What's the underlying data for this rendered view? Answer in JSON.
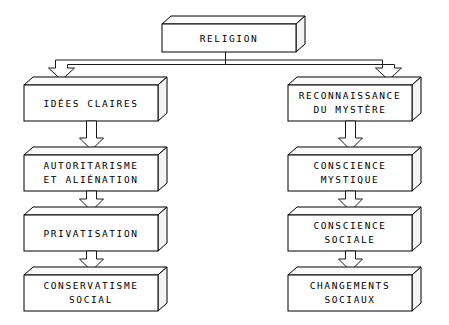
{
  "diagram": {
    "title": "RELIGION",
    "root": {
      "id": "religion",
      "label": "RELIGION",
      "lines": [
        "RELIGION"
      ]
    },
    "branches": [
      {
        "id": "left-branch",
        "name": "idees-claires-chain",
        "nodes": [
          {
            "id": "idees-claires",
            "lines": [
              "IDÉES CLAIRES"
            ]
          },
          {
            "id": "autoritarisme",
            "lines": [
              "AUTORITARISME",
              "ET ALIÉNATION"
            ]
          },
          {
            "id": "privatisation",
            "lines": [
              "PRIVATISATION"
            ]
          },
          {
            "id": "conservatisme",
            "lines": [
              "CONSERVATISME",
              "SOCIAL"
            ]
          }
        ]
      },
      {
        "id": "right-branch",
        "name": "reconnaissance-chain",
        "nodes": [
          {
            "id": "reconnaissance",
            "lines": [
              "RECONNAISSANCE",
              "DU MYSTÈRE"
            ]
          },
          {
            "id": "conscience-mystique",
            "lines": [
              "CONSCIENCE",
              "MYSTIQUE"
            ]
          },
          {
            "id": "conscience-sociale",
            "lines": [
              "CONSCIENCE",
              "SOCIALE"
            ]
          },
          {
            "id": "changements-sociaux",
            "lines": [
              "CHANGEMENTS",
              "SOCIAUX"
            ]
          }
        ]
      }
    ],
    "colors": {
      "background": "#ffffff",
      "stroke": "#000000",
      "face": "#ffffff",
      "text": "#000000"
    }
  }
}
